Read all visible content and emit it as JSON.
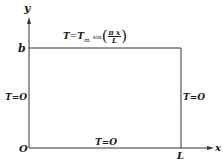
{
  "diagram": {
    "axes": {
      "x_label": "x",
      "y_label": "y",
      "origin_label": "O"
    },
    "corner_labels": {
      "top_left": "b",
      "bottom_right": "L"
    },
    "boundary_conditions": {
      "top": {
        "lhs": "T",
        "eq": "=",
        "rhs_T": "T",
        "rhs_sub": "m",
        "func": "sin",
        "num": "π x",
        "den": "L"
      },
      "left": "T=O",
      "right": "T=O",
      "bottom": "T=O"
    }
  }
}
